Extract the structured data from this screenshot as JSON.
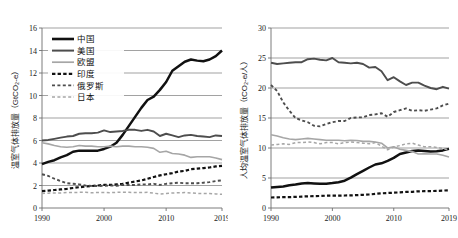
{
  "figure": {
    "background": "#ffffff",
    "panels": [
      "total-emissions",
      "per-capita-emissions"
    ]
  },
  "colors": {
    "china": "#111111",
    "usa": "#4d4d4d",
    "eu": "#a6a6a6",
    "india": "#111111",
    "russia": "#4d4d4d",
    "japan": "#a6a6a6",
    "grid": "#7a7a7a",
    "axis": "#6e6e6e",
    "text": "#1a1a1a"
  },
  "legend": {
    "position": "top-left",
    "entries": [
      {
        "label": "中国",
        "color": "#111111",
        "style": "solid",
        "width": 2.6
      },
      {
        "label": "美国",
        "color": "#4d4d4d",
        "style": "solid",
        "width": 2.0
      },
      {
        "label": "欧盟",
        "color": "#a6a6a6",
        "style": "solid",
        "width": 1.7
      },
      {
        "label": "印度",
        "color": "#111111",
        "style": "dashed",
        "width": 2.2
      },
      {
        "label": "俄罗斯",
        "color": "#4d4d4d",
        "style": "dashed",
        "width": 1.9
      },
      {
        "label": "日本",
        "color": "#a6a6a6",
        "style": "dashed",
        "width": 1.6
      }
    ]
  },
  "chart_data": [
    {
      "type": "line",
      "id": "total-emissions",
      "title": "",
      "xlabel": "",
      "ylabel": "温室气体排放量（GtCO₂-e）",
      "xlim": [
        1990,
        2019
      ],
      "ylim": [
        0,
        16
      ],
      "yticks": [
        0,
        2,
        4,
        6,
        8,
        10,
        12,
        14,
        16
      ],
      "ytick_labels": [
        "0",
        "2",
        "4",
        "6",
        "8",
        "10",
        "12",
        "14",
        "16"
      ],
      "xticks": [
        1990,
        2000,
        2010,
        2019
      ],
      "xtick_labels": [
        "1990",
        "2000",
        "2010",
        "2019"
      ],
      "grid": "horizontal",
      "legend": "top-left",
      "x": [
        1990,
        1991,
        1992,
        1993,
        1994,
        1995,
        1996,
        1997,
        1998,
        1999,
        2000,
        2001,
        2002,
        2003,
        2004,
        2005,
        2006,
        2007,
        2008,
        2009,
        2010,
        2011,
        2012,
        2013,
        2014,
        2015,
        2016,
        2017,
        2018,
        2019
      ],
      "series": [
        {
          "name": "中国",
          "color": "#111111",
          "style": "solid",
          "values": [
            3.9,
            4.1,
            4.25,
            4.5,
            4.7,
            5.0,
            5.1,
            5.1,
            5.1,
            5.1,
            5.25,
            5.45,
            5.8,
            6.5,
            7.3,
            8.1,
            8.9,
            9.6,
            9.9,
            10.5,
            11.2,
            12.2,
            12.6,
            13.0,
            13.2,
            13.1,
            13.05,
            13.2,
            13.5,
            14.0
          ]
        },
        {
          "name": "美国",
          "color": "#4d4d4d",
          "style": "solid",
          "values": [
            6.0,
            6.05,
            6.15,
            6.25,
            6.35,
            6.4,
            6.6,
            6.65,
            6.65,
            6.7,
            6.9,
            6.75,
            6.8,
            6.85,
            6.95,
            6.95,
            6.85,
            6.95,
            6.8,
            6.4,
            6.6,
            6.45,
            6.3,
            6.45,
            6.5,
            6.4,
            6.35,
            6.3,
            6.45,
            6.4
          ]
        },
        {
          "name": "欧盟",
          "color": "#a6a6a6",
          "style": "solid",
          "values": [
            5.8,
            5.7,
            5.55,
            5.45,
            5.4,
            5.45,
            5.55,
            5.5,
            5.5,
            5.45,
            5.45,
            5.5,
            5.45,
            5.5,
            5.5,
            5.45,
            5.45,
            5.4,
            5.3,
            4.95,
            5.05,
            4.85,
            4.8,
            4.7,
            4.5,
            4.55,
            4.55,
            4.55,
            4.45,
            4.3
          ]
        },
        {
          "name": "印度",
          "color": "#111111",
          "style": "dashed",
          "values": [
            1.5,
            1.55,
            1.6,
            1.65,
            1.7,
            1.78,
            1.85,
            1.9,
            1.95,
            2.0,
            2.05,
            2.05,
            2.1,
            2.15,
            2.25,
            2.35,
            2.45,
            2.6,
            2.75,
            2.9,
            3.0,
            3.1,
            3.25,
            3.3,
            3.45,
            3.5,
            3.55,
            3.6,
            3.7,
            3.75
          ]
        },
        {
          "name": "俄罗斯",
          "color": "#4d4d4d",
          "style": "dashed",
          "values": [
            3.0,
            2.85,
            2.6,
            2.4,
            2.2,
            2.15,
            2.1,
            2.0,
            1.95,
            1.95,
            1.98,
            2.0,
            1.98,
            2.05,
            2.05,
            2.05,
            2.1,
            2.1,
            2.15,
            2.05,
            2.15,
            2.2,
            2.25,
            2.2,
            2.2,
            2.2,
            2.25,
            2.3,
            2.4,
            2.45
          ]
        },
        {
          "name": "日本",
          "color": "#a6a6a6",
          "style": "dashed",
          "values": [
            1.3,
            1.32,
            1.33,
            1.33,
            1.38,
            1.38,
            1.39,
            1.39,
            1.35,
            1.38,
            1.38,
            1.36,
            1.39,
            1.4,
            1.39,
            1.38,
            1.37,
            1.39,
            1.32,
            1.24,
            1.3,
            1.33,
            1.36,
            1.37,
            1.34,
            1.3,
            1.3,
            1.28,
            1.25,
            1.22
          ]
        }
      ]
    },
    {
      "type": "line",
      "id": "per-capita-emissions",
      "title": "",
      "xlabel": "",
      "ylabel": "人均温室气体排放量（tCO₂-e/人）",
      "xlim": [
        1990,
        2019
      ],
      "ylim": [
        0,
        30
      ],
      "yticks": [
        0,
        5,
        10,
        15,
        20,
        25,
        30
      ],
      "ytick_labels": [
        "0",
        "5",
        "10",
        "15",
        "20",
        "25",
        "30"
      ],
      "xticks": [
        1990,
        2000,
        2010,
        2019
      ],
      "xtick_labels": [
        "1990",
        "2000",
        "2010",
        "2019"
      ],
      "grid": "horizontal",
      "legend": "none",
      "x": [
        1990,
        1991,
        1992,
        1993,
        1994,
        1995,
        1996,
        1997,
        1998,
        1999,
        2000,
        2001,
        2002,
        2003,
        2004,
        2005,
        2006,
        2007,
        2008,
        2009,
        2010,
        2011,
        2012,
        2013,
        2014,
        2015,
        2016,
        2017,
        2018,
        2019
      ],
      "series": [
        {
          "name": "中国",
          "color": "#111111",
          "style": "solid",
          "values": [
            3.4,
            3.5,
            3.6,
            3.8,
            3.9,
            4.1,
            4.15,
            4.1,
            4.05,
            4.05,
            4.15,
            4.3,
            4.55,
            5.05,
            5.65,
            6.2,
            6.75,
            7.25,
            7.45,
            7.85,
            8.35,
            9.0,
            9.25,
            9.5,
            9.6,
            9.5,
            9.4,
            9.45,
            9.6,
            9.85
          ]
        },
        {
          "name": "美国",
          "color": "#4d4d4d",
          "style": "solid",
          "values": [
            24.2,
            24.0,
            24.1,
            24.2,
            24.3,
            24.3,
            24.8,
            24.9,
            24.7,
            24.6,
            25.0,
            24.3,
            24.2,
            24.1,
            24.2,
            24.0,
            23.4,
            23.5,
            22.8,
            21.3,
            21.8,
            21.1,
            20.5,
            20.9,
            20.9,
            20.4,
            20.0,
            19.8,
            20.2,
            19.9
          ]
        },
        {
          "name": "欧盟",
          "color": "#a6a6a6",
          "style": "solid",
          "values": [
            12.2,
            12.0,
            11.7,
            11.5,
            11.4,
            11.5,
            11.6,
            11.5,
            11.4,
            11.3,
            11.3,
            11.3,
            11.2,
            11.3,
            11.25,
            11.1,
            11.1,
            11.0,
            10.8,
            10.0,
            10.2,
            9.8,
            9.6,
            9.4,
            9.0,
            9.05,
            9.0,
            9.0,
            8.8,
            8.5
          ]
        },
        {
          "name": "印度",
          "color": "#111111",
          "style": "dashed",
          "values": [
            1.75,
            1.78,
            1.8,
            1.82,
            1.85,
            1.9,
            1.95,
            1.98,
            2.0,
            2.05,
            2.05,
            2.05,
            2.08,
            2.1,
            2.15,
            2.2,
            2.25,
            2.35,
            2.45,
            2.5,
            2.55,
            2.6,
            2.68,
            2.7,
            2.78,
            2.8,
            2.82,
            2.85,
            2.9,
            2.95
          ]
        },
        {
          "name": "俄罗斯",
          "color": "#4d4d4d",
          "style": "dashed",
          "values": [
            20.5,
            19.5,
            17.6,
            16.2,
            15.0,
            14.6,
            14.3,
            13.7,
            13.6,
            14.0,
            14.3,
            14.5,
            14.5,
            15.0,
            15.1,
            15.1,
            15.5,
            15.6,
            15.8,
            15.2,
            16.0,
            16.3,
            16.6,
            16.2,
            16.3,
            16.2,
            16.4,
            16.6,
            17.1,
            17.4
          ]
        },
        {
          "name": "日本",
          "color": "#a6a6a6",
          "style": "dashed",
          "values": [
            10.5,
            10.6,
            10.7,
            10.6,
            10.9,
            10.9,
            11.0,
            10.9,
            10.7,
            10.9,
            10.9,
            10.7,
            10.9,
            11.0,
            10.9,
            10.8,
            10.7,
            10.9,
            10.3,
            9.7,
            10.2,
            10.4,
            10.7,
            10.8,
            10.5,
            10.2,
            10.2,
            10.1,
            9.9,
            9.7
          ]
        }
      ]
    }
  ]
}
